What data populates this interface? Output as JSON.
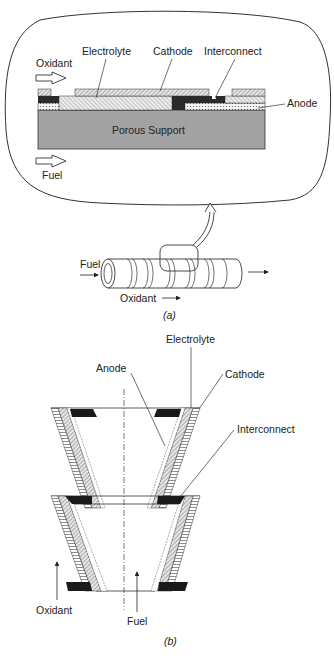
{
  "figure_a": {
    "caption": "(a)",
    "inset_labels": {
      "oxidant": "Oxidant",
      "electrolyte": "Electrolyte",
      "cathode": "Cathode",
      "interconnect": "Interconnect",
      "anode": "Anode",
      "porous_support": "Porous Support",
      "fuel": "Fuel"
    },
    "tube_labels": {
      "fuel": "Fuel",
      "oxidant": "Oxidant"
    }
  },
  "figure_b": {
    "caption": "(b)",
    "labels": {
      "electrolyte": "Electrolyte",
      "anode": "Anode",
      "cathode": "Cathode",
      "interconnect": "Interconnect",
      "oxidant": "Oxidant",
      "fuel": "Fuel"
    }
  },
  "colors": {
    "line": "#333333",
    "support": "#a9a9a9",
    "interconnect": "#1a1a1a",
    "background": "#ffffff"
  }
}
